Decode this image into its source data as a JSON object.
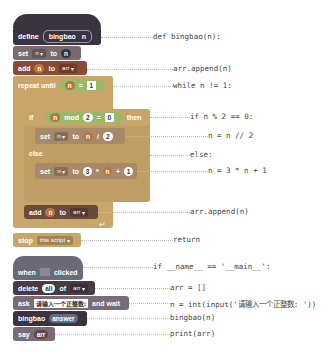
{
  "blocks": {
    "define": {
      "keyword": "define",
      "name": "bingbao",
      "param": "n"
    },
    "set1": {
      "keyword": "set",
      "var": "n",
      "to": "to",
      "value": "n"
    },
    "add1": {
      "keyword": "add",
      "item": "n",
      "to": "to",
      "list": "arr"
    },
    "repeat": {
      "keyword": "repeat until",
      "left": "n",
      "op": "=",
      "right": "1"
    },
    "if": {
      "keyword": "if",
      "a": "n",
      "op": "mod",
      "b": "2",
      "eq": "=",
      "c": "0",
      "then": "then"
    },
    "set2": {
      "keyword": "set",
      "var": "n",
      "to": "to",
      "a": "n",
      "op": "/",
      "b": "2"
    },
    "else": {
      "keyword": "else"
    },
    "set3": {
      "keyword": "set",
      "var": "n",
      "to": "to",
      "a": "3",
      "op1": "*",
      "b": "n",
      "op2": "+",
      "c": "1"
    },
    "add2": {
      "keyword": "add",
      "item": "n",
      "to": "to",
      "list": "arr"
    },
    "stop": {
      "keyword": "stop",
      "option": "this script"
    },
    "when": {
      "keyword": "when",
      "clicked": "clicked",
      "flag_icon": "green-flag"
    },
    "delete": {
      "keyword": "delete",
      "option": "all",
      "of": "of",
      "list": "arr"
    },
    "ask": {
      "keyword": "ask",
      "prompt": "请输入一个正整数:",
      "wait": "and wait"
    },
    "call": {
      "name": "bingbao",
      "arg": "answer"
    },
    "say": {
      "keyword": "say",
      "value": "arr"
    }
  },
  "code": {
    "def": "def bingbao(n):",
    "append1": "arr.append(n)",
    "while": "while n != 1:",
    "if": "if n % 2 == 0:",
    "half": "n = n // 2",
    "else": "else:",
    "triple": "n = 3 * n + 1",
    "append2": "arr.append(n)",
    "return": "return",
    "main": "if __name__ == '__main__':",
    "arr": "arr = []",
    "input": "n = int(input('请输入一个正整数: '))",
    "call": "bingbao(n)",
    "print": "print(arr)"
  }
}
